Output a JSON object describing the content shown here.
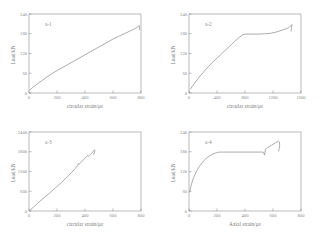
{
  "figure": {
    "background": "#ffffff",
    "line_color": "#8a8a8a",
    "text_color": "#8a8a8a"
  },
  "panels": [
    {
      "tag": "a-1",
      "position": "top-left",
      "xlabel": "circular strain/με",
      "ylabel": "Load/kN",
      "xticks": [
        "0",
        "200",
        "400",
        "600",
        "800"
      ],
      "yticks": [
        "0",
        "60",
        "120",
        "180",
        "240"
      ],
      "xlim": [
        0,
        800
      ],
      "ylim": [
        0,
        240
      ]
    },
    {
      "tag": "a-2",
      "position": "top-right",
      "xlabel": "circular strain/με",
      "ylabel": "Load/kN",
      "xticks": [
        "0",
        "400",
        "800",
        "1200",
        "1600"
      ],
      "yticks": [
        "0",
        "60",
        "120",
        "180",
        "240"
      ],
      "xlim": [
        0,
        1600
      ],
      "ylim": [
        0,
        240
      ]
    },
    {
      "tag": "a-3",
      "position": "bottom-left",
      "xlabel": "circular strain/με",
      "ylabel": "Load/kN",
      "xticks": [
        "0",
        "200",
        "400",
        "600",
        "800"
      ],
      "yticks": [
        "0",
        "600",
        "1200",
        "1800",
        "2400"
      ],
      "xlim": [
        0,
        800
      ],
      "ylim": [
        0,
        2400
      ]
    },
    {
      "tag": "a-4",
      "position": "bottom-right",
      "xlabel": "Axial strain/με",
      "ylabel": "Load/kN",
      "xticks": [
        "0",
        "200",
        "400",
        "600",
        "800"
      ],
      "yticks": [
        "0",
        "60",
        "120",
        "180",
        "240"
      ],
      "xlim": [
        0,
        800
      ],
      "ylim": [
        0,
        240
      ]
    }
  ],
  "chart_data": [
    {
      "type": "line",
      "title": "a-1",
      "xlabel": "circular strain/με",
      "ylabel": "Load/kN",
      "xlim": [
        0,
        800
      ],
      "ylim": [
        0,
        240
      ],
      "xticks": [
        0,
        200,
        400,
        600,
        800
      ],
      "yticks": [
        0,
        60,
        120,
        180,
        240
      ],
      "grid": false,
      "legend": false,
      "series": [
        {
          "name": "a-1 load-circular strain",
          "x": [
            8,
            30,
            60,
            100,
            150,
            200,
            250,
            300,
            350,
            400,
            450,
            500,
            550,
            600,
            640,
            680,
            720,
            760,
            780,
            788,
            790,
            788
          ],
          "y": [
            10,
            18,
            28,
            40,
            55,
            68,
            80,
            92,
            104,
            116,
            128,
            140,
            152,
            164,
            172,
            180,
            188,
            196,
            202,
            205,
            200,
            192
          ]
        }
      ]
    },
    {
      "type": "line",
      "title": "a-2",
      "xlabel": "circular strain/με",
      "ylabel": "Load/kN",
      "xlim": [
        0,
        1600
      ],
      "ylim": [
        0,
        240
      ],
      "xticks": [
        0,
        400,
        800,
        1200,
        1600
      ],
      "yticks": [
        0,
        60,
        120,
        180,
        240
      ],
      "grid": false,
      "legend": false,
      "series": [
        {
          "name": "a-2 load-circular strain",
          "x": [
            20,
            80,
            160,
            250,
            340,
            430,
            520,
            610,
            700,
            760,
            800,
            900,
            1000,
            1080,
            1160,
            1260,
            1360,
            1420,
            1460,
            1470,
            1465,
            1460
          ],
          "y": [
            12,
            30,
            52,
            74,
            94,
            112,
            130,
            148,
            166,
            176,
            179,
            179,
            179,
            180,
            181,
            186,
            193,
            198,
            205,
            208,
            198,
            188
          ]
        }
      ]
    },
    {
      "type": "line",
      "title": "a-3",
      "xlabel": "circular strain/με",
      "ylabel": "Load/kN",
      "xlim": [
        0,
        800
      ],
      "ylim": [
        0,
        2400
      ],
      "xticks": [
        0,
        200,
        400,
        600,
        800
      ],
      "yticks": [
        0,
        600,
        1200,
        1800,
        2400
      ],
      "grid": false,
      "legend": false,
      "series": [
        {
          "name": "a-3 load-circular strain",
          "x": [
            8,
            30,
            60,
            100,
            140,
            180,
            220,
            260,
            300,
            330,
            350,
            352,
            356,
            370,
            390,
            410,
            420,
            425,
            440,
            455,
            462,
            468,
            470,
            466,
            462
          ],
          "y": [
            30,
            110,
            230,
            380,
            520,
            670,
            820,
            980,
            1150,
            1290,
            1400,
            1440,
            1420,
            1470,
            1560,
            1650,
            1690,
            1660,
            1720,
            1790,
            1830,
            1860,
            1800,
            1760,
            1720
          ]
        }
      ]
    },
    {
      "type": "line",
      "title": "a-4",
      "xlabel": "Axial strain/με",
      "ylabel": "Load/kN",
      "xlim": [
        0,
        800
      ],
      "ylim": [
        0,
        240
      ],
      "xticks": [
        0,
        200,
        400,
        600,
        800
      ],
      "yticks": [
        0,
        60,
        120,
        180,
        240
      ],
      "grid": false,
      "legend": false,
      "series": [
        {
          "name": "a-4 load-axial strain",
          "x": [
            5,
            15,
            30,
            50,
            75,
            100,
            125,
            150,
            170,
            190,
            205,
            215,
            230,
            300,
            400,
            480,
            530,
            540,
            545,
            560,
            590,
            620,
            640,
            645,
            648,
            645,
            640
          ],
          "y": [
            58,
            78,
            98,
            118,
            136,
            150,
            161,
            168,
            173,
            176,
            178,
            179,
            179,
            179,
            179,
            179,
            179,
            170,
            186,
            192,
            200,
            208,
            212,
            210,
            200,
            190,
            182
          ]
        }
      ]
    }
  ]
}
